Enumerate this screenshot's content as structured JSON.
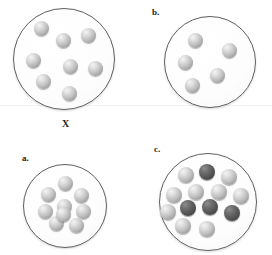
{
  "figure": {
    "background_color": "#ffffff",
    "width": 272,
    "height": 255,
    "seam_line": {
      "y": 105,
      "color": "#f2f2f2"
    }
  },
  "colors": {
    "sphere_light": "#bdbdbd",
    "sphere_dark": "#575757",
    "circle_outline": "#5e5e5e",
    "circle_fill": "#fdfdfd",
    "label_text": "#1a1a1a"
  },
  "panels": [
    {
      "id": "target",
      "label": "X",
      "label_position": "below",
      "label_x": 62,
      "label_y": 119,
      "circle": {
        "cx": 64,
        "cy": 59,
        "r": 51
      },
      "sphere_radius": 7.5,
      "counts": {
        "light": 8,
        "dark": 0,
        "total": 8
      },
      "spheres": [
        {
          "x": 41,
          "y": 28,
          "shade": "light"
        },
        {
          "x": 63,
          "y": 40,
          "shade": "light"
        },
        {
          "x": 88,
          "y": 35,
          "shade": "light"
        },
        {
          "x": 33,
          "y": 60,
          "shade": "light"
        },
        {
          "x": 70,
          "y": 66,
          "shade": "light"
        },
        {
          "x": 95,
          "y": 68,
          "shade": "light"
        },
        {
          "x": 43,
          "y": 81,
          "shade": "light"
        },
        {
          "x": 69,
          "y": 93,
          "shade": "light"
        }
      ]
    },
    {
      "id": "b",
      "label": "b.",
      "label_position": "above",
      "label_x": 152,
      "label_y": 8,
      "circle": {
        "cx": 210,
        "cy": 62,
        "r": 46
      },
      "sphere_radius": 7.5,
      "counts": {
        "light": 5,
        "dark": 0,
        "total": 5
      },
      "spheres": [
        {
          "x": 195,
          "y": 40,
          "shade": "light"
        },
        {
          "x": 229,
          "y": 50,
          "shade": "light"
        },
        {
          "x": 185,
          "y": 62,
          "shade": "light"
        },
        {
          "x": 217,
          "y": 75,
          "shade": "light"
        },
        {
          "x": 192,
          "y": 85,
          "shade": "light"
        }
      ]
    },
    {
      "id": "a",
      "label": "a.",
      "label_position": "above",
      "label_x": 22,
      "label_y": 154,
      "circle": {
        "cx": 65,
        "cy": 206,
        "r": 42
      },
      "sphere_radius": 7.5,
      "counts": {
        "light": 9,
        "dark": 0,
        "total": 9
      },
      "spheres": [
        {
          "x": 65,
          "y": 183,
          "shade": "light"
        },
        {
          "x": 48,
          "y": 194,
          "shade": "light"
        },
        {
          "x": 81,
          "y": 195,
          "shade": "light"
        },
        {
          "x": 64,
          "y": 206,
          "shade": "light"
        },
        {
          "x": 45,
          "y": 211,
          "shade": "light"
        },
        {
          "x": 83,
          "y": 211,
          "shade": "light"
        },
        {
          "x": 56,
          "y": 223,
          "shade": "light"
        },
        {
          "x": 76,
          "y": 225,
          "shade": "light"
        },
        {
          "x": 63,
          "y": 214,
          "shade": "light"
        }
      ]
    },
    {
      "id": "c",
      "label": "c.",
      "label_position": "above",
      "label_x": 154,
      "label_y": 145,
      "circle": {
        "cx": 208,
        "cy": 202,
        "r": 49
      },
      "sphere_radius": 8,
      "counts": {
        "light": 9,
        "dark": 4,
        "total": 13
      },
      "spheres": [
        {
          "x": 186,
          "y": 175,
          "shade": "light"
        },
        {
          "x": 207,
          "y": 172,
          "shade": "dark"
        },
        {
          "x": 229,
          "y": 177,
          "shade": "light"
        },
        {
          "x": 196,
          "y": 192,
          "shade": "light"
        },
        {
          "x": 219,
          "y": 192,
          "shade": "light"
        },
        {
          "x": 174,
          "y": 195,
          "shade": "light"
        },
        {
          "x": 241,
          "y": 196,
          "shade": "light"
        },
        {
          "x": 188,
          "y": 208,
          "shade": "dark"
        },
        {
          "x": 210,
          "y": 207,
          "shade": "dark"
        },
        {
          "x": 232,
          "y": 213,
          "shade": "dark"
        },
        {
          "x": 183,
          "y": 226,
          "shade": "light"
        },
        {
          "x": 207,
          "y": 229,
          "shade": "light"
        },
        {
          "x": 168,
          "y": 212,
          "shade": "light"
        }
      ]
    }
  ]
}
